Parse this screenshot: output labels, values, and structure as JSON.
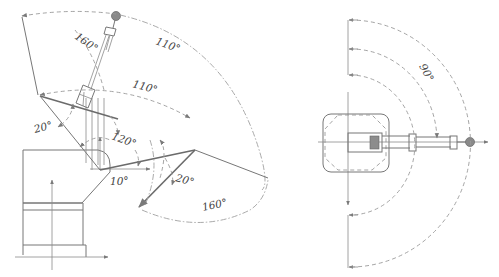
{
  "diagram": {
    "side_view": {
      "labels": {
        "a1": "160°",
        "a2": "110°",
        "a3": "110°",
        "a4": "20°",
        "a5": "120°",
        "a6": "10°",
        "a7": "20°",
        "a8": "160°"
      }
    },
    "top_view": {
      "labels": {
        "a1": "90°"
      }
    },
    "colors": {
      "line": "#777777",
      "dash": "#9a9a9a",
      "text": "#444444",
      "background": "#ffffff"
    }
  }
}
